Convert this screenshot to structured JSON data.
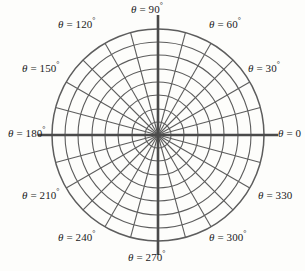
{
  "figure": {
    "kind": "polar-coordinate-grid",
    "symbol": "θ",
    "equals": "=",
    "degree_sign": "°",
    "background_color": "#fdfdfb",
    "grid_color": "#5d5d5d",
    "axis_color": "#4a4a4a",
    "text_color": "#1b1b1b"
  },
  "chart_data": {
    "type": "polar_grid",
    "title": "",
    "center": {
      "x": 158,
      "y": 135
    },
    "outer_radius": 106,
    "radial_step_degrees": 15,
    "label_step_degrees": 30,
    "num_spokes": 24,
    "num_circles": 8,
    "circle_radii": [
      13,
      26,
      40,
      53,
      66,
      80,
      93,
      106
    ],
    "bold_axis_angles": [
      0,
      90,
      180,
      270
    ],
    "angle_labels": [
      {
        "angle": 90,
        "value": "90",
        "text": "θ = 90°",
        "truncated": false
      },
      {
        "angle": 60,
        "value": "60",
        "text": "θ = 60°",
        "truncated": false
      },
      {
        "angle": 30,
        "value": "30",
        "text": "θ = 30°",
        "truncated": false
      },
      {
        "angle": 0,
        "value": "0",
        "text": "θ = 0",
        "truncated": true
      },
      {
        "angle": 330,
        "value": "330",
        "text": "θ = 330",
        "truncated": true
      },
      {
        "angle": 300,
        "value": "300",
        "text": "θ = 300°",
        "truncated": false
      },
      {
        "angle": 270,
        "value": "270",
        "text": "θ = 270°",
        "truncated": false
      },
      {
        "angle": 240,
        "value": "240",
        "text": "θ = 240°",
        "truncated": false
      },
      {
        "angle": 210,
        "value": "210",
        "text": "θ = 210°",
        "truncated": false
      },
      {
        "angle": 180,
        "value": "180",
        "text": "θ = 180°",
        "truncated": false
      },
      {
        "angle": 150,
        "value": "150",
        "text": "θ = 150°",
        "truncated": false
      },
      {
        "angle": 120,
        "value": "120",
        "text": "θ = 120°",
        "truncated": false
      }
    ]
  },
  "labels": {
    "deg_90": {
      "theta": "θ",
      "eq": "=",
      "val": "90",
      "deg": "°"
    },
    "deg_60": {
      "theta": "θ",
      "eq": "=",
      "val": "60",
      "deg": "°"
    },
    "deg_30": {
      "theta": "θ",
      "eq": "=",
      "val": "30",
      "deg": "°"
    },
    "deg_0": {
      "theta": "θ",
      "eq": "=",
      "val": "0",
      "deg": ""
    },
    "deg_330": {
      "theta": "θ",
      "eq": "=",
      "val": "330",
      "deg": ""
    },
    "deg_300": {
      "theta": "θ",
      "eq": "=",
      "val": "300",
      "deg": "°"
    },
    "deg_270": {
      "theta": "θ",
      "eq": "=",
      "val": "270",
      "deg": "°"
    },
    "deg_240": {
      "theta": "θ",
      "eq": "=",
      "val": "240",
      "deg": "°"
    },
    "deg_210": {
      "theta": "θ",
      "eq": "=",
      "val": "210",
      "deg": "°"
    },
    "deg_180": {
      "theta": "θ",
      "eq": "=",
      "val": "180",
      "deg": "°"
    },
    "deg_150": {
      "theta": "θ",
      "eq": "=",
      "val": "150",
      "deg": "°"
    },
    "deg_120": {
      "theta": "θ",
      "eq": "=",
      "val": "120",
      "deg": "°"
    }
  }
}
